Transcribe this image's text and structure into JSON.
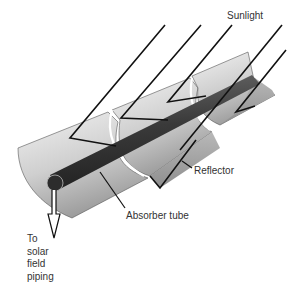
{
  "diagram": {
    "labels": {
      "sunlight": "Sunlight",
      "reflector": "Reflector",
      "absorber_tube": "Absorber tube",
      "outlet": "To\nsolar\nfield\npiping"
    },
    "colors": {
      "background": "#ffffff",
      "ray": "#111111",
      "tube": "#3a3a3a",
      "reflector_light": "#e8e8e8",
      "reflector_dark": "#9a9a9a",
      "label_text": "#333333"
    }
  }
}
